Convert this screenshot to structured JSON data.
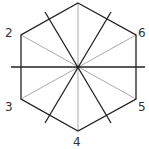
{
  "diagram": {
    "shape": "regular hexagon with symmetry axes",
    "colors": {
      "edge": "#222222",
      "light_axis": "#aaaaaa",
      "dark_axis": "#222222"
    },
    "vertex_labels": [
      {
        "id": "v2",
        "text": "2"
      },
      {
        "id": "v3",
        "text": "3"
      },
      {
        "id": "v4",
        "text": "4"
      },
      {
        "id": "v5",
        "text": "5"
      },
      {
        "id": "v6",
        "text": "6"
      }
    ]
  }
}
